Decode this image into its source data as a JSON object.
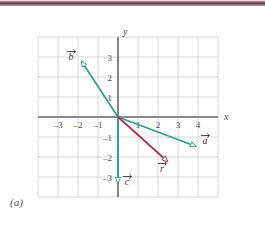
{
  "figure": {
    "caption": "(a)",
    "axis_labels": {
      "x": "x",
      "y": "y"
    },
    "colors": {
      "teal": "#2e9e93",
      "crimson": "#a8314f",
      "grid": "#d8d8d8",
      "axis": "#6b6b6b",
      "topbar": "#7c4a5c",
      "text": "#4a4a4a"
    },
    "axes": {
      "xmin": -4,
      "xmax": 5,
      "ymin": -4,
      "ymax": 4,
      "unit_px": 20,
      "origin_px": {
        "x": 118,
        "y": 117
      },
      "grid": true
    },
    "x_ticks": [
      {
        "value": -3,
        "label": "–3"
      },
      {
        "value": -2,
        "label": "–2"
      },
      {
        "value": -1,
        "label": "–1"
      },
      {
        "value": 1,
        "label": "1"
      },
      {
        "value": 2,
        "label": "2"
      },
      {
        "value": 3,
        "label": "3"
      },
      {
        "value": 4,
        "label": "4"
      }
    ],
    "y_ticks": [
      {
        "value": 3,
        "label": "3"
      },
      {
        "value": 2,
        "label": "2"
      },
      {
        "value": 1,
        "label": "1"
      },
      {
        "value": -1,
        "label": "–1"
      },
      {
        "value": -2,
        "label": "–2"
      },
      {
        "value": -3,
        "label": "–3"
      }
    ],
    "vectors": [
      {
        "name": "b",
        "label": "b",
        "color": "#2e9e93",
        "from": {
          "x": 0,
          "y": 0
        },
        "to": {
          "x": -1.8,
          "y": 2.75
        },
        "label_pos": {
          "x": -2.35,
          "y": 2.85
        }
      },
      {
        "name": "a",
        "label": "a",
        "color": "#2e9e93",
        "from": {
          "x": 0,
          "y": 0
        },
        "to": {
          "x": 3.85,
          "y": -1.45
        },
        "label_pos": {
          "x": 4.35,
          "y": -1.35
        }
      },
      {
        "name": "c",
        "label": "c",
        "color": "#2e9e93",
        "from": {
          "x": 0,
          "y": 0
        },
        "to": {
          "x": 0,
          "y": -3.25
        },
        "label_pos": {
          "x": 0.45,
          "y": -3.4
        }
      },
      {
        "name": "r",
        "label": "r",
        "color": "#a8314f",
        "from": {
          "x": 0,
          "y": 0
        },
        "to": {
          "x": 2.45,
          "y": -2.2
        },
        "label_pos": {
          "x": 2.2,
          "y": -2.75
        }
      }
    ]
  }
}
